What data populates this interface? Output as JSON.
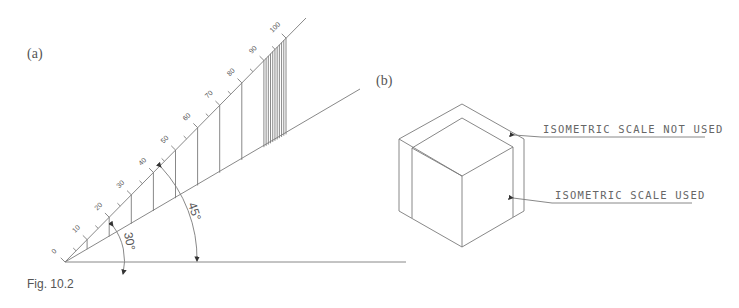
{
  "figure": {
    "caption": "Fig. 10.2",
    "panel_a": {
      "label": "(a)",
      "scale_labels": [
        "0",
        "10",
        "20",
        "30",
        "40",
        "50",
        "60",
        "70",
        "80",
        "90",
        "100"
      ],
      "true_scale_angle": "45°",
      "isometric_axis_angle": "30°"
    },
    "panel_b": {
      "label": "(b)",
      "callouts": [
        {
          "text": "ISOMETRIC SCALE NOT USED"
        },
        {
          "text": "ISOMETRIC SCALE USED"
        }
      ]
    }
  },
  "colors": {
    "line": "#7a7a7a",
    "text": "#555555",
    "background": "#ffffff"
  }
}
